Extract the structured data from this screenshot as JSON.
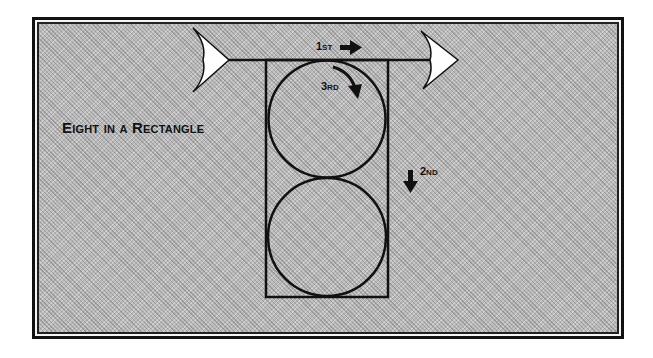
{
  "diagram": {
    "title": "Eight in a Rectangle",
    "steps": [
      {
        "label": "1st",
        "direction": "right-arrow"
      },
      {
        "label": "2nd",
        "direction": "down-arrow"
      },
      {
        "label": "3rd",
        "direction": "curved-clockwise-arrow"
      }
    ],
    "shapes": {
      "rectangle": "tall rectangle containing two stacked circles",
      "circles": 2,
      "arrow_shaft": "horizontal arrow with fletching at both ends across top of rectangle"
    },
    "colors": {
      "background_texture": "#b9b9b9",
      "stroke": "#111111",
      "fletching_fill": "#ffffff",
      "frame": "#111111"
    }
  }
}
